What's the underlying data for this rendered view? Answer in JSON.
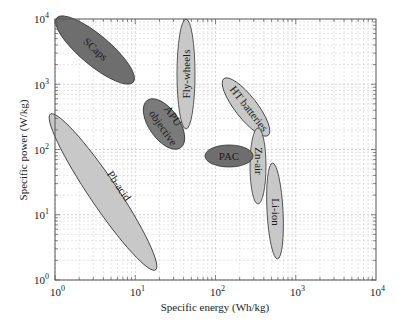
{
  "chart_data": {
    "type": "scatter",
    "subtype": "ragone-plot",
    "title": "",
    "xlabel": "Specific energy (Wh/kg)",
    "ylabel": "Specific power (W/kg)",
    "xscale": "log",
    "yscale": "log",
    "xlim": [
      1,
      10000
    ],
    "ylim": [
      1,
      10000
    ],
    "grid": true,
    "x_ticks": [
      "10^0",
      "10^1",
      "10^2",
      "10^3",
      "10^4"
    ],
    "y_ticks": [
      "10^0",
      "10^1",
      "10^2",
      "10^3",
      "10^4"
    ],
    "regions": [
      {
        "name": "SCaps",
        "fill": "#6e6e6e",
        "energy_range": [
          1.5,
          8
        ],
        "power_range": [
          1200,
          8000
        ],
        "angle": 40
      },
      {
        "name": "Fly-wheels",
        "fill": "#c8c8c8",
        "energy_range": [
          35,
          50
        ],
        "power_range": [
          200,
          9000
        ],
        "angle": 90
      },
      {
        "name": "APU objective",
        "fill": "#7a7a7a",
        "energy_range": [
          18,
          40
        ],
        "power_range": [
          100,
          400
        ],
        "angle": 55
      },
      {
        "name": "HT batteries",
        "fill": "#c8c8c8",
        "energy_range": [
          120,
          500
        ],
        "power_range": [
          200,
          1300
        ],
        "angle": 50
      },
      {
        "name": "PAC",
        "fill": "#6e6e6e",
        "energy_range": [
          70,
          250
        ],
        "power_range": [
          60,
          110
        ],
        "angle": 0
      },
      {
        "name": "Zn-air",
        "fill": "#c8c8c8",
        "energy_range": [
          300,
          400
        ],
        "power_range": [
          25,
          200
        ],
        "angle": 90
      },
      {
        "name": "Li-ion",
        "fill": "#c8c8c8",
        "energy_range": [
          500,
          750
        ],
        "power_range": [
          2,
          60
        ],
        "angle": 92
      },
      {
        "name": "Pb-acid",
        "fill": "#c8c8c8",
        "energy_range": [
          1.5,
          30
        ],
        "power_range": [
          1.5,
          200
        ],
        "angle": 55
      }
    ]
  },
  "labels": {
    "SCaps": "SCaps",
    "Flywheels": "Fly-wheels",
    "APU1": "APU",
    "APU2": "objective",
    "HT": "HT batteries",
    "PAC": "PAC",
    "Znair": "Zn-air",
    "Liion": "Li-ion",
    "Pbacid": "Pb-acid"
  },
  "axes": {
    "xlabel": "Specific energy (Wh/kg)",
    "ylabel": "Specific power (W/kg)",
    "xticks": [
      {
        "base": "10",
        "exp": "0"
      },
      {
        "base": "10",
        "exp": "1"
      },
      {
        "base": "10",
        "exp": "2"
      },
      {
        "base": "10",
        "exp": "3"
      },
      {
        "base": "10",
        "exp": "4"
      }
    ],
    "yticks": [
      {
        "base": "10",
        "exp": "0"
      },
      {
        "base": "10",
        "exp": "1"
      },
      {
        "base": "10",
        "exp": "2"
      },
      {
        "base": "10",
        "exp": "3"
      },
      {
        "base": "10",
        "exp": "4"
      }
    ]
  }
}
